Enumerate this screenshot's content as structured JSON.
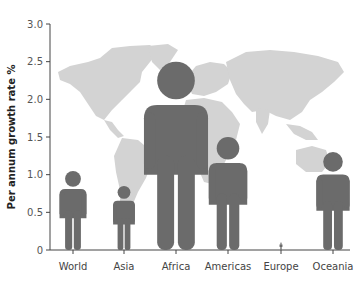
{
  "chart_data": {
    "type": "bar",
    "title": "",
    "xlabel": "",
    "ylabel": "Per annum growth rate %",
    "ylim": [
      0,
      3.0
    ],
    "yticks": [
      0,
      0.5,
      1.0,
      1.5,
      2.0,
      2.5,
      3.0
    ],
    "ytick_labels": [
      "0",
      "0.5",
      "1.0",
      "1.5",
      "2.0",
      "2.5",
      "3.0"
    ],
    "categories": [
      "World",
      "Asia",
      "Africa",
      "Americas",
      "Europe",
      "Oceania"
    ],
    "values": [
      1.05,
      0.85,
      2.5,
      1.5,
      0.1,
      1.3
    ],
    "bar_style": "pictogram-person",
    "background": "world-map",
    "grid": false,
    "legend": null,
    "colors": {
      "figure": "#6b6b6b",
      "map": "#d3d3d3",
      "axis": "#444444"
    }
  }
}
